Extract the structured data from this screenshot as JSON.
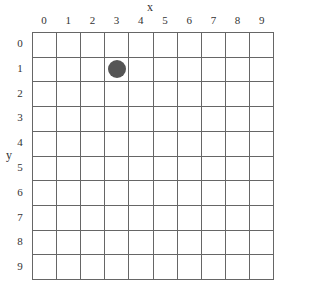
{
  "axes": {
    "x_label": "x",
    "y_label": "y",
    "x_ticks": [
      "0",
      "1",
      "2",
      "3",
      "4",
      "5",
      "6",
      "7",
      "8",
      "9"
    ],
    "y_ticks": [
      "0",
      "1",
      "2",
      "3",
      "4",
      "5",
      "6",
      "7",
      "8",
      "9"
    ]
  },
  "grid": {
    "columns": 10,
    "rows": 10,
    "line_color": "#666666"
  },
  "markers": [
    {
      "shape": "circle",
      "col": 3,
      "row": 1,
      "color": "#555555"
    }
  ]
}
